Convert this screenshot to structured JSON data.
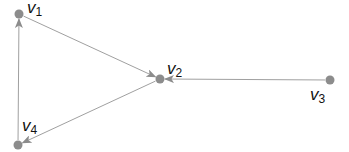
{
  "diagram": {
    "type": "directed-graph",
    "colors": {
      "node": "#8c8c8c",
      "edge": "#a0a0a0",
      "label": "#111111"
    },
    "nodes": [
      {
        "id": "v1",
        "label": "v",
        "sub": "1",
        "x": 19,
        "y": 14
      },
      {
        "id": "v2",
        "label": "v",
        "sub": "2",
        "x": 160,
        "y": 79
      },
      {
        "id": "v3",
        "label": "v",
        "sub": "3",
        "x": 330,
        "y": 80
      },
      {
        "id": "v4",
        "label": "v",
        "sub": "4",
        "x": 18,
        "y": 145
      }
    ],
    "edges": [
      {
        "from": "v1",
        "to": "v2"
      },
      {
        "from": "v3",
        "to": "v2"
      },
      {
        "from": "v2",
        "to": "v4"
      },
      {
        "from": "v4",
        "to": "v1"
      }
    ]
  }
}
